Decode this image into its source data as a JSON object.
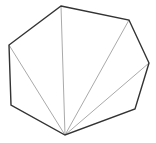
{
  "diagram": {
    "title": "",
    "type": "polygon-fan-triangulation",
    "colors": {
      "background": "#ffffff",
      "outline": "#333333",
      "diagonal": "#aaaaaa"
    },
    "vertices": [
      {
        "id": "v0",
        "x": 61,
        "y": 6
      },
      {
        "id": "v1",
        "x": 129,
        "y": 20
      },
      {
        "id": "v2",
        "x": 149,
        "y": 63
      },
      {
        "id": "v3",
        "x": 135,
        "y": 109
      },
      {
        "id": "v4",
        "x": 65,
        "y": 135
      },
      {
        "id": "v5",
        "x": 11,
        "y": 105
      },
      {
        "id": "v6",
        "x": 9,
        "y": 45
      }
    ],
    "fan_apex": "v4",
    "diagonals": [
      {
        "from": "v4",
        "to": "v6"
      },
      {
        "from": "v4",
        "to": "v0"
      },
      {
        "from": "v4",
        "to": "v1"
      },
      {
        "from": "v4",
        "to": "v2"
      }
    ]
  }
}
